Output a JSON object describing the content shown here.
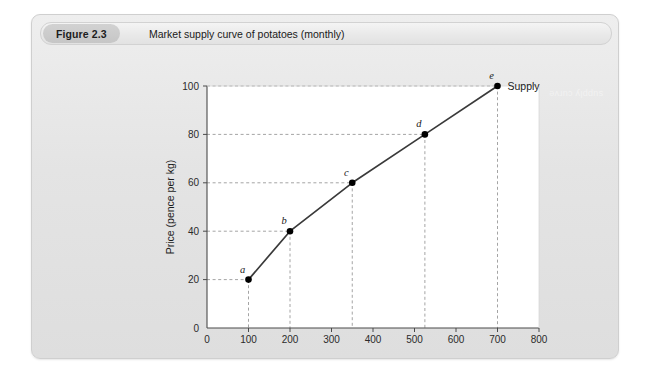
{
  "figure": {
    "number_label": "Figure 2.3",
    "caption": "Market supply curve of potatoes (monthly)"
  },
  "ghost_text": "supply curve",
  "colors": {
    "card_bg": "#e4e4e4",
    "card_border": "#cfcfcf",
    "header_bg": "#ebebeb",
    "pill_bg": "#cbcbcb",
    "plot_bg": "#ffffff",
    "axis": "#4a4a4a",
    "curve": "#3a3a3a",
    "marker": "#000000",
    "gridline": "#9a9a9a"
  },
  "chart_data": {
    "type": "line",
    "title": "Market supply curve of potatoes (monthly)",
    "xlabel": "Quantity (tonnes: 000s)",
    "ylabel": "Price (pence per kg)",
    "xlim": [
      0,
      800
    ],
    "ylim": [
      0,
      100
    ],
    "xticks": [
      0,
      100,
      200,
      300,
      400,
      500,
      600,
      700,
      800
    ],
    "yticks": [
      0,
      20,
      40,
      60,
      80,
      100
    ],
    "xticklabels": [
      "0",
      "100",
      "200",
      "300",
      "400",
      "500",
      "600",
      "700",
      "800"
    ],
    "yticklabels": [
      "0",
      "20",
      "40",
      "60",
      "80",
      "100"
    ],
    "grid": "dashed-guides-to-points",
    "legend": "inline-series-label",
    "series": [
      {
        "name": "Supply",
        "point_labels": [
          "a",
          "b",
          "c",
          "d",
          "e"
        ],
        "x": [
          100,
          200,
          350,
          525,
          700
        ],
        "y": [
          20,
          40,
          60,
          80,
          100
        ]
      }
    ],
    "annotations": [
      {
        "text": "Supply",
        "x": 700,
        "y": 100,
        "position": "right-of-point-e"
      },
      {
        "text": "a",
        "x": 100,
        "y": 20,
        "position": "above-left"
      },
      {
        "text": "b",
        "x": 200,
        "y": 40,
        "position": "above-left"
      },
      {
        "text": "c",
        "x": 350,
        "y": 60,
        "position": "above-left"
      },
      {
        "text": "d",
        "x": 525,
        "y": 80,
        "position": "above-left"
      },
      {
        "text": "e",
        "x": 700,
        "y": 100,
        "position": "above-left"
      }
    ]
  }
}
